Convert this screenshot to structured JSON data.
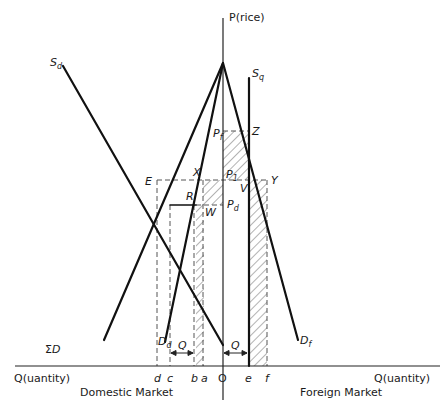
{
  "diagram": {
    "axes": {
      "vertical_label": "P(rice)",
      "left_horizontal_label": "Q(uantity)",
      "right_horizontal_label": "Q(uantity)",
      "origin_label": "O"
    },
    "markets": {
      "left": "Domestic Market",
      "right": "Foreign Market"
    },
    "curves": {
      "sum_demand": {
        "label": "ΣD",
        "base": "Σ",
        "rest": "D"
      },
      "domestic_supply": {
        "base": "S",
        "sub": "d"
      },
      "domestic_demand": {
        "base": "D",
        "sub": "d"
      },
      "foreign_demand": {
        "base": "D",
        "sub": "f"
      },
      "quota_supply": {
        "base": "S",
        "sub": "q"
      }
    },
    "points": {
      "E": "E",
      "X": "X",
      "R": "R",
      "W": "W",
      "Z": "Z",
      "V": "V",
      "Y": "Y"
    },
    "prices": {
      "foreign": {
        "base": "P",
        "sub": "f"
      },
      "single": {
        "base": "P",
        "sub": "1"
      },
      "domestic": {
        "base": "P",
        "sub": "d"
      }
    },
    "quantity_ticks": [
      "d",
      "c",
      "b",
      "a",
      "O",
      "e",
      "f"
    ],
    "quota_labels": {
      "domestic": "Q",
      "foreign": "Q"
    }
  }
}
